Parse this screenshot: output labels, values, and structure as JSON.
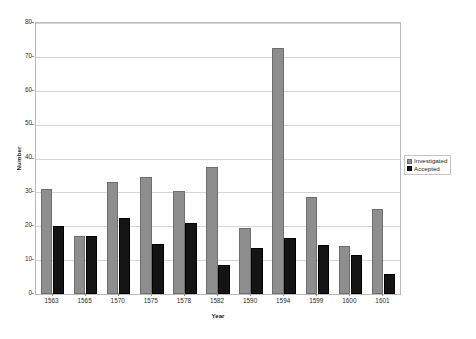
{
  "chart_data": {
    "type": "bar",
    "title": "",
    "xlabel": "Year",
    "ylabel": "Number",
    "categories": [
      "1563",
      "1565",
      "1570",
      "1575",
      "1578",
      "1582",
      "1590",
      "1594",
      "1599",
      "1600",
      "1601"
    ],
    "series": [
      {
        "name": "Investigated",
        "color": "#8e8e8e",
        "values": [
          31,
          17,
          33,
          34.5,
          30.5,
          37.5,
          19.6,
          72.5,
          28.5,
          14.3,
          25
        ]
      },
      {
        "name": "Accepted",
        "color": "#141414",
        "values": [
          20,
          17,
          22.5,
          14.8,
          21,
          8.7,
          13.5,
          16.5,
          14.5,
          11.5,
          6
        ]
      }
    ],
    "ylim": [
      0,
      80
    ],
    "yticks": [
      0,
      10,
      20,
      30,
      40,
      50,
      60,
      70,
      80
    ],
    "ytick_labels": [
      "0",
      "10",
      "20",
      "30",
      "40",
      "50",
      "60",
      "70",
      "80"
    ],
    "grid": true,
    "legend_position": "right"
  },
  "legend": {
    "entries": [
      {
        "label": "Investigated",
        "swatch": "legend-swatch-investigated"
      },
      {
        "label": "Accepted",
        "swatch": "legend-swatch-accepted"
      }
    ]
  }
}
